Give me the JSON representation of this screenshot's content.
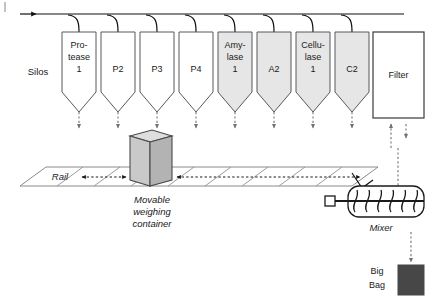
{
  "diagram": {
    "left_label": "Silos",
    "rail_label": "Rail",
    "container_label_line1": "Movable",
    "container_label_line2": "weighing",
    "container_label_line3": "container",
    "mixer_label": "Mixer",
    "bigbag_label_line1": "Big",
    "bigbag_label_line2": "Bag",
    "filter_label": "Filter"
  },
  "colors": {
    "silo_white_fill": "#ffffff",
    "silo_gray_fill": "#e6e6e6",
    "silo_stroke": "#55595c",
    "line": "#111111",
    "dashed": "#6e7276",
    "container_front": "#c9c9c9",
    "container_side": "#b3b3b3",
    "container_top": "#dedede",
    "bigbag_fill": "#474747",
    "background": "#ffffff"
  },
  "silos": [
    {
      "id": "silo-1",
      "lines": [
        "Pro-",
        "tease",
        "1"
      ],
      "fill": "white",
      "x": 62,
      "width": 34
    },
    {
      "id": "silo-2",
      "lines": [
        "P2"
      ],
      "fill": "white",
      "x": 101,
      "width": 34
    },
    {
      "id": "silo-3",
      "lines": [
        "P3"
      ],
      "fill": "white",
      "x": 140,
      "width": 34
    },
    {
      "id": "silo-4",
      "lines": [
        "P4"
      ],
      "fill": "white",
      "x": 179,
      "width": 34
    },
    {
      "id": "silo-5",
      "lines": [
        "Amy-",
        "lase",
        "1"
      ],
      "fill": "gray",
      "x": 218,
      "width": 34
    },
    {
      "id": "silo-6",
      "lines": [
        "A2"
      ],
      "fill": "gray",
      "x": 257,
      "width": 34
    },
    {
      "id": "silo-7",
      "lines": [
        "Cellu-",
        "lase",
        "1"
      ],
      "fill": "gray",
      "x": 296,
      "width": 34
    },
    {
      "id": "silo-8",
      "lines": [
        "C2"
      ],
      "fill": "gray",
      "x": 335,
      "width": 34
    }
  ],
  "filter": {
    "x": 373,
    "y": 32,
    "width": 51,
    "height": 86
  },
  "mixer": {
    "paddle_count": 6,
    "x": 348,
    "y": 186,
    "width": 76,
    "height": 31
  },
  "geometry": {
    "silo_top_y": 32,
    "silo_body_bottom_y": 92,
    "silo_cone_tip_y": 112,
    "feed_line_y": 14,
    "feed_arrow_x": 44,
    "rail_top_y": 167,
    "rail_bottom_y": 186
  }
}
